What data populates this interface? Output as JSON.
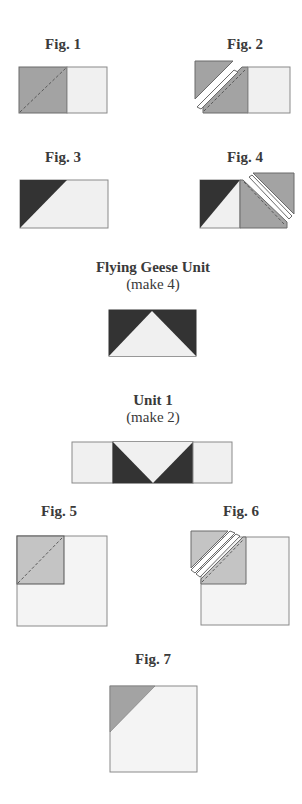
{
  "colors": {
    "medium_gray": "#a3a3a3",
    "light_gray": "#e9e9e9",
    "pale": "#f4f4f4",
    "dark": "#333333",
    "outline": "#707070",
    "stitch": "#606060"
  },
  "figures": [
    {
      "id": "fig1",
      "label": "Fig. 1"
    },
    {
      "id": "fig2",
      "label": "Fig. 2"
    },
    {
      "id": "fig3",
      "label": "Fig. 3"
    },
    {
      "id": "fig4",
      "label": "Fig. 4"
    },
    {
      "id": "flying_geese",
      "label": "Flying Geese Unit",
      "sublabel": "(make 4)"
    },
    {
      "id": "unit1",
      "label": "Unit 1",
      "sublabel": "(make 2)"
    },
    {
      "id": "fig5",
      "label": "Fig. 5"
    },
    {
      "id": "fig6",
      "label": "Fig. 6"
    },
    {
      "id": "fig7",
      "label": "Fig. 7"
    }
  ]
}
